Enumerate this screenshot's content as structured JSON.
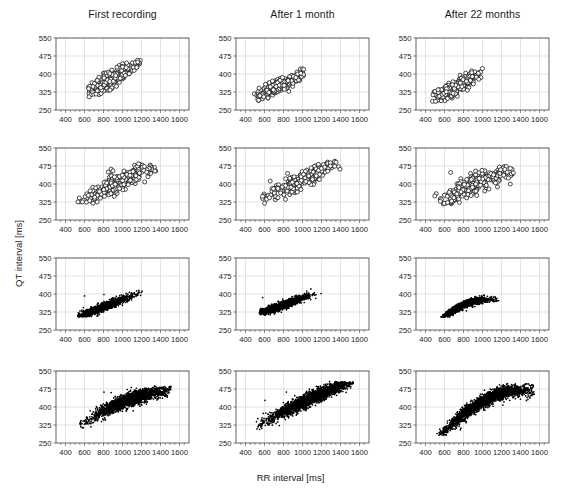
{
  "figure": {
    "xlabel": "RR interval [ms]",
    "ylabel": "QT interval [ms]",
    "column_titles": [
      "First recording",
      "After 1 month",
      "After 22 months"
    ]
  },
  "chart_data": {
    "type": "scatter",
    "title": "",
    "xlabel": "RR interval [ms]",
    "ylabel": "QT interval [ms]",
    "xlim": [
      300,
      1700
    ],
    "ylim": [
      250,
      550
    ],
    "xticks": [
      400,
      600,
      800,
      1000,
      1200,
      1400,
      1600
    ],
    "yticks": [
      250,
      325,
      400,
      475,
      550
    ],
    "grid": true,
    "legend": "none",
    "layout": {
      "rows": 4,
      "cols": 3
    },
    "column_titles": [
      "First recording",
      "After 1 month",
      "After 22 months"
    ],
    "row_marker_styles": [
      "open-circle",
      "open-circle",
      "filled-dot",
      "filled-dot"
    ],
    "panels": [
      {
        "row": 1,
        "col": 1,
        "title": "First recording",
        "marker": "open-circle",
        "n_points": 260,
        "x_range": [
          620,
          1190
        ],
        "y_range": [
          288,
          452
        ],
        "trend": "linear",
        "model": {
          "intercept": 175,
          "slope": 0.232,
          "scatter_y": 17,
          "curvature": 0.0
        },
        "x_density": "gauss",
        "x_mean": 880,
        "x_sd": 130,
        "outliers": [
          [
            1105,
            447
          ],
          [
            1135,
            448
          ],
          [
            1160,
            450
          ],
          [
            1150,
            427
          ]
        ]
      },
      {
        "row": 1,
        "col": 2,
        "title": "After 1 month",
        "marker": "open-circle",
        "n_points": 250,
        "x_range": [
          480,
          1020
        ],
        "y_range": [
          290,
          418
        ],
        "trend": "linear",
        "model": {
          "intercept": 208,
          "slope": 0.192,
          "scatter_y": 15,
          "curvature": 0.0
        },
        "x_density": "gauss",
        "x_mean": 740,
        "x_sd": 130,
        "outliers": []
      },
      {
        "row": 1,
        "col": 3,
        "title": "After 22 months",
        "marker": "open-circle",
        "n_points": 265,
        "x_range": [
          470,
          1000
        ],
        "y_range": [
          285,
          420
        ],
        "trend": "linear",
        "model": {
          "intercept": 200,
          "slope": 0.205,
          "scatter_y": 16,
          "curvature": 0.0
        },
        "x_density": "gauss",
        "x_mean": 720,
        "x_sd": 135,
        "outliers": [
          [
            960,
            378
          ]
        ]
      },
      {
        "row": 2,
        "col": 1,
        "title": "First recording",
        "marker": "open-circle",
        "n_points": 300,
        "x_range": [
          530,
          1370
        ],
        "y_range": [
          320,
          480
        ],
        "trend": "slightly-curved",
        "model": {
          "intercept": 228,
          "slope": 0.186,
          "scatter_y": 19,
          "curvature": -0.04
        },
        "x_density": "gauss",
        "x_mean": 970,
        "x_sd": 190,
        "outliers": [
          [
            880,
            462
          ],
          [
            900,
            455
          ]
        ]
      },
      {
        "row": 2,
        "col": 2,
        "title": "After 1 month",
        "marker": "open-circle",
        "n_points": 300,
        "x_range": [
          540,
          1410
        ],
        "y_range": [
          325,
          492
        ],
        "trend": "linear",
        "model": {
          "intercept": 222,
          "slope": 0.196,
          "scatter_y": 18,
          "curvature": 0.0
        },
        "x_density": "gauss",
        "x_mean": 1020,
        "x_sd": 195,
        "outliers": [
          [
            660,
            412
          ]
        ]
      },
      {
        "row": 2,
        "col": 3,
        "title": "After 22 months",
        "marker": "open-circle",
        "n_points": 300,
        "x_range": [
          490,
          1330
        ],
        "y_range": [
          318,
          470
        ],
        "trend": "slightly-curved",
        "model": {
          "intercept": 232,
          "slope": 0.183,
          "scatter_y": 20,
          "curvature": -0.05
        },
        "x_density": "gauss",
        "x_mean": 900,
        "x_sd": 215,
        "outliers": [
          [
            665,
            448
          ],
          [
            880,
            352
          ],
          [
            940,
            352
          ]
        ]
      },
      {
        "row": 3,
        "col": 1,
        "title": "First recording",
        "marker": "filled-dot",
        "n_points": 1400,
        "x_range": [
          530,
          1210
        ],
        "y_range": [
          308,
          418
        ],
        "trend": "linear",
        "model": {
          "intercept": 225,
          "slope": 0.152,
          "scatter_y": 8,
          "curvature": 0.0
        },
        "x_density": "gauss",
        "x_mean": 800,
        "x_sd": 145,
        "outliers": [
          [
            600,
            392
          ],
          [
            805,
            398
          ]
        ]
      },
      {
        "row": 3,
        "col": 2,
        "title": "After 1 month",
        "marker": "filled-dot",
        "n_points": 1300,
        "x_range": [
          545,
          1215
        ],
        "y_range": [
          318,
          416
        ],
        "trend": "linear",
        "model": {
          "intercept": 243,
          "slope": 0.14,
          "scatter_y": 8,
          "curvature": 0.0
        },
        "x_density": "gauss",
        "x_mean": 790,
        "x_sd": 140,
        "outliers": [
          [
            580,
            385
          ],
          [
            1040,
            380
          ],
          [
            1140,
            382
          ],
          [
            1195,
            402
          ]
        ]
      },
      {
        "row": 3,
        "col": 3,
        "title": "After 22 months",
        "marker": "filled-dot",
        "n_points": 1300,
        "x_range": [
          510,
          1175
        ],
        "y_range": [
          310,
          402
        ],
        "trend": "curved",
        "model": {
          "intercept": 236,
          "slope": 0.148,
          "scatter_y": 7,
          "curvature": -0.12
        },
        "x_density": "gauss",
        "x_mean": 790,
        "x_sd": 150,
        "outliers": [
          [
            830,
            330
          ]
        ]
      },
      {
        "row": 4,
        "col": 1,
        "title": "First recording",
        "marker": "filled-dot",
        "n_points": 2000,
        "x_range": [
          545,
          1510
        ],
        "y_range": [
          318,
          482
        ],
        "trend": "curved",
        "model": {
          "intercept": 262,
          "slope": 0.158,
          "scatter_y": 14,
          "curvature": -0.1
        },
        "x_density": "gauss",
        "x_mean": 1080,
        "x_sd": 215,
        "outliers": [
          [
            560,
            318
          ],
          [
            805,
            462
          ],
          [
            880,
            460
          ],
          [
            1395,
            462
          ],
          [
            1445,
            462
          ],
          [
            1490,
            462
          ]
        ]
      },
      {
        "row": 4,
        "col": 2,
        "title": "After 1 month",
        "marker": "filled-dot",
        "n_points": 2100,
        "x_range": [
          515,
          1545
        ],
        "y_range": [
          310,
          500
        ],
        "trend": "linear",
        "model": {
          "intercept": 232,
          "slope": 0.188,
          "scatter_y": 14,
          "curvature": -0.03
        },
        "x_density": "gauss",
        "x_mean": 1100,
        "x_sd": 250,
        "outliers": [
          [
            605,
            428
          ],
          [
            830,
            462
          ],
          [
            940,
            440
          ],
          [
            1205,
            438
          ],
          [
            1270,
            450
          ]
        ]
      },
      {
        "row": 4,
        "col": 3,
        "title": "After 22 months",
        "marker": "filled-dot",
        "n_points": 2100,
        "x_range": [
          500,
          1545
        ],
        "y_range": [
          288,
          492
        ],
        "trend": "curved",
        "model": {
          "intercept": 218,
          "slope": 0.205,
          "scatter_y": 14,
          "curvature": -0.22
        },
        "x_density": "gauss",
        "x_mean": 1000,
        "x_sd": 265,
        "outliers": [
          [
            1020,
            470
          ],
          [
            1095,
            472
          ],
          [
            1165,
            468
          ],
          [
            1215,
            408
          ],
          [
            1250,
            432
          ]
        ]
      }
    ]
  }
}
